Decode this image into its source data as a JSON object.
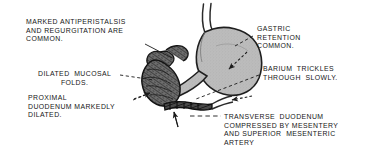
{
  "figure": {
    "background_color": "#ffffff",
    "ink_color": "#161616",
    "organ_fill_light": "#b9b9b9",
    "organ_fill_dark": "#555555",
    "caption_style": "uppercase"
  },
  "labels": [
    {
      "name": "label-antiperistalsis",
      "lines": [
        "MARKED ANTIPERISTALSIS",
        "AND REGURGITATION ARE",
        "COMMON."
      ],
      "align": "left",
      "x": 26,
      "y": 18
    },
    {
      "name": "label-dilated-mucosal-folds",
      "lines": [
        "DILATED  MUCOSAL",
        "FOLDS."
      ],
      "align": "center",
      "x": 38,
      "y": 70
    },
    {
      "name": "label-proximal-duodenum",
      "lines": [
        "PROXIMAL",
        "DUODENUM MARKEDLY",
        "DILATED."
      ],
      "align": "left",
      "x": 28,
      "y": 94
    },
    {
      "name": "label-gastric-retention",
      "lines": [
        "GASTRIC",
        "RETENTION",
        "COMMON."
      ],
      "align": "left",
      "x": 257,
      "y": 25
    },
    {
      "name": "label-barium-trickles",
      "lines": [
        "BARIUM  TRICKLES",
        "THROUGH  SLOWLY."
      ],
      "align": "left",
      "x": 263,
      "y": 65
    },
    {
      "name": "label-transverse-duodenum",
      "lines": [
        "TRANSVERSE  DUODENUM",
        "COMPRESSED BY MESENTERY",
        "AND SUPERIOR  MESENTERIC",
        "ARTERY"
      ],
      "align": "left",
      "x": 224,
      "y": 113
    }
  ],
  "anatomy": {
    "parts": [
      {
        "name": "esophagus",
        "fill": "none"
      },
      {
        "name": "stomach",
        "fill": "#b9b9b9"
      },
      {
        "name": "pylorus",
        "fill": "#b9b9b9"
      },
      {
        "name": "duodenal-bulb",
        "fill": "#6a6a6a"
      },
      {
        "name": "proximal-duodenum-dilated",
        "fill": "#5a5a5a"
      },
      {
        "name": "transverse-duodenum-compressed",
        "fill": "#3c3c3c"
      }
    ]
  },
  "leaders": [
    {
      "name": "leader-antiperistalsis",
      "style": "solid"
    },
    {
      "name": "leader-dilated-mucosal-folds",
      "style": "dashed"
    },
    {
      "name": "leader-proximal-duodenum",
      "style": "dashed"
    },
    {
      "name": "leader-gastric-retention",
      "style": "dashed"
    },
    {
      "name": "leader-barium-trickles",
      "style": "dashed"
    },
    {
      "name": "leader-transverse-duodenum",
      "style": "dashed"
    }
  ],
  "arrows": [
    {
      "name": "arrow-gastric-retention",
      "direction": "down-left"
    },
    {
      "name": "arrow-barium-trickles",
      "direction": "left"
    },
    {
      "name": "arrow-transverse-duodenum",
      "direction": "up"
    },
    {
      "name": "arrow-proximal-duodenum",
      "direction": "down-right"
    }
  ]
}
